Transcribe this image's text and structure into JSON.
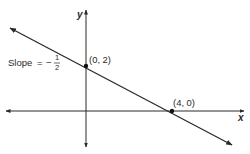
{
  "diagram": {
    "type": "coordinate-plane-line",
    "axes": {
      "x_label": "x",
      "y_label": "y"
    },
    "points": [
      {
        "label": "(0, 2)",
        "x": 0,
        "y": 2
      },
      {
        "label": "(4, 0)",
        "x": 4,
        "y": 0
      }
    ],
    "slope": {
      "prefix": "Slope",
      "equals": "=",
      "sign": "−",
      "numerator": "1",
      "denominator": "2"
    },
    "colors": {
      "line": "#2a2a2a",
      "background": "#ffffff"
    }
  }
}
